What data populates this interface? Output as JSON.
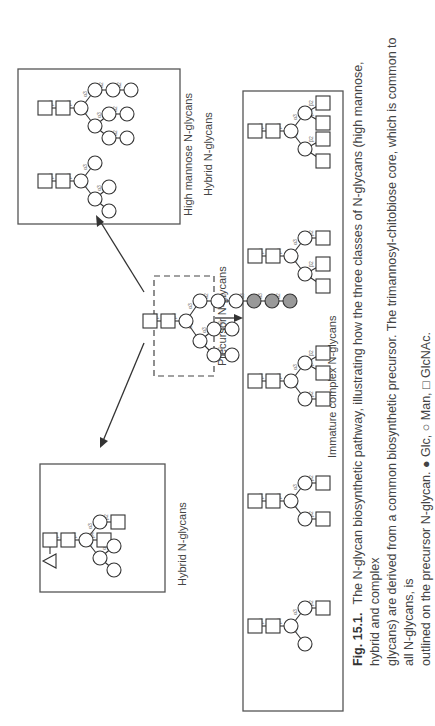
{
  "figure": {
    "number": "Fig. 15.1.",
    "caption_lines": [
      "The N-glycan biosynthetic pathway, illustrating how the three classes of N-glycans (high mannose, hybrid and complex",
      "glycans) are derived from a common biosynthetic precursor. The trimannosyl-chitobiose core, which is common to all N-glycans, is",
      "outlined on the precursor N-glycan. ● Glc, ○ Man, □ GlcNAc."
    ],
    "legend": [
      {
        "symbol": "filled-circle",
        "label": "Glc"
      },
      {
        "symbol": "open-circle",
        "label": "Man"
      },
      {
        "symbol": "open-square",
        "label": "GlcNAc"
      }
    ]
  },
  "panels": {
    "precursor": {
      "label": "Precursor N-glycans"
    },
    "high_mannose": {
      "label": "High mannose N-glycans"
    },
    "hybrid": {
      "label": "Hybrid N-glycans"
    },
    "hybrid_secondary_label": {
      "label": "Hybrid N-glycans"
    },
    "complex": {
      "label": "Immature complex N-glycans"
    }
  },
  "linkages": {
    "b4": "β4",
    "a3": "α3",
    "a6": "α6",
    "a2": "α2",
    "b2": "β2",
    "a1": "α1",
    "a16": "α6",
    "f1": "α1-6"
  },
  "structures": {
    "precursor": "Glc3Man9GlcNAc2",
    "high_mannose": [
      "Man9GlcNAc2",
      "Man5GlcNAc2"
    ],
    "hybrid": [
      "GlcNAcMan5GlcNAc2 (fucosylated, bisected)"
    ],
    "complex": [
      "GlcNAc4Man3GlcNAc2",
      "GlcNAc3Man3GlcNAc2 (6-branched)",
      "GlcNAc3Man3GlcNAc2 (3-branched)",
      "GlcNAc2Man3GlcNAc2",
      "GlcNAcMan3GlcNAc2"
    ]
  }
}
